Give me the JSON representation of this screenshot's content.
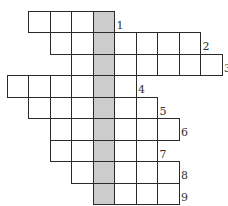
{
  "puzzle": {
    "type": "crossword",
    "cell_size": 21.5,
    "origin_x": 7,
    "origin_y": 11,
    "key_column": 4,
    "colors": {
      "cell": "#ffffff",
      "key_cell": "#cccccc",
      "border": "#2a2a2a",
      "number": "#333333"
    },
    "rows": [
      {
        "number": "1",
        "start_col": 1,
        "end_col": 4
      },
      {
        "number": "2",
        "start_col": 2,
        "end_col": 8
      },
      {
        "number": "3",
        "start_col": 3,
        "end_col": 9
      },
      {
        "number": "4",
        "start_col": 0,
        "end_col": 5
      },
      {
        "number": "5",
        "start_col": 1,
        "end_col": 6
      },
      {
        "number": "6",
        "start_col": 2,
        "end_col": 7
      },
      {
        "number": "7",
        "start_col": 2,
        "end_col": 6
      },
      {
        "number": "8",
        "start_col": 3,
        "end_col": 7
      },
      {
        "number": "9",
        "start_col": 4,
        "end_col": 7
      }
    ]
  }
}
